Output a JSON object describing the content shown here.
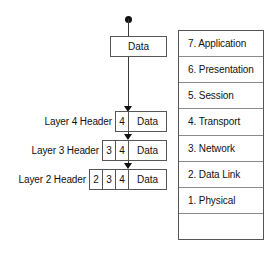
{
  "diagram": {
    "accent_color": "#111111",
    "border_color": "#555555",
    "background_color": "#ffffff"
  },
  "flow": {
    "origin_marker": "filled-dot",
    "top_payload": {
      "label": "Data"
    },
    "arrow_count": 3,
    "rows": [
      {
        "label": "Layer 4 Header",
        "headers": [
          "4"
        ],
        "payload": "Data"
      },
      {
        "label": "Layer 3 Header",
        "headers": [
          "3",
          "4"
        ],
        "payload": "Data"
      },
      {
        "label": "Layer 2 Header",
        "headers": [
          "2",
          "3",
          "4"
        ],
        "payload": "Data"
      }
    ]
  },
  "osi_stack": {
    "layers": [
      {
        "label": "7. Application"
      },
      {
        "label": "6. Presentation"
      },
      {
        "label": "5. Session"
      },
      {
        "label": "4. Transport"
      },
      {
        "label": "3. Network"
      },
      {
        "label": "2. Data Link"
      },
      {
        "label": "1. Physical"
      },
      {
        "label": ""
      }
    ]
  }
}
